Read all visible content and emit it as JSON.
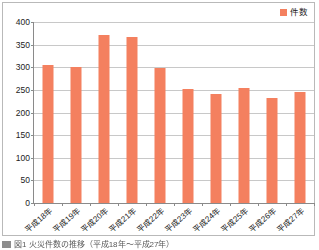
{
  "chart_data": {
    "type": "bar",
    "title": "",
    "xlabel": "",
    "ylabel": "",
    "ylim": [
      0,
      400
    ],
    "ytick_step": 50,
    "yticks": [
      400,
      350,
      300,
      250,
      200,
      150,
      100,
      50,
      0
    ],
    "grid": true,
    "legend_position": "top-right",
    "bar_color": "#f4805f",
    "categories": [
      "平成18年",
      "平成19年",
      "平成20年",
      "平成21年",
      "平成22年",
      "平成23年",
      "平成24年",
      "平成25年",
      "平成26年",
      "平成27年"
    ],
    "series": [
      {
        "name": "件数",
        "values": [
          306,
          300,
          372,
          367,
          298,
          253,
          242,
          254,
          233,
          246
        ]
      }
    ]
  },
  "legend": {
    "items": [
      {
        "label": "件数",
        "color": "#f4805f",
        "icon": "square-swatch-icon"
      }
    ]
  },
  "caption": {
    "marker_icon": "figure-marker-icon",
    "text": "図1  火災件数の推移（平成18年～平成27年）"
  }
}
